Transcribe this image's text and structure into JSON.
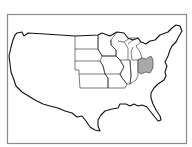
{
  "map": {
    "title": "United States map with Midwest states outlined",
    "region_outlined": "Midwest",
    "outlined_states": [
      "North Dakota",
      "South Dakota",
      "Nebraska",
      "Kansas",
      "Minnesota",
      "Iowa",
      "Missouri",
      "Wisconsin",
      "Illinois",
      "Michigan",
      "Indiana",
      "Ohio"
    ],
    "highlighted_state": "Ohio",
    "colors": {
      "highlight_fill": "#a9a9a9",
      "outline": "#111111",
      "frame": "#8a8a8a",
      "background": "#ffffff"
    }
  }
}
